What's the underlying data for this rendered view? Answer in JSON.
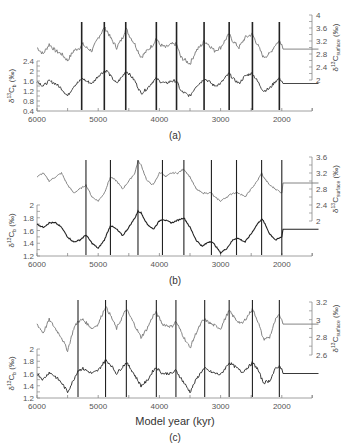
{
  "chart_data": [
    {
      "type": "line",
      "panel_label": "(a)",
      "x_direction": "reversed",
      "xlim": [
        6000,
        1400
      ],
      "x_ticks": [
        "6000",
        "5000",
        "4000",
        "3000",
        "2000"
      ],
      "left_axis": {
        "label": "δ13Cb (‰)",
        "ticks": [
          "0.4",
          "0.8",
          "1.2",
          "1.6",
          "2",
          "2.4"
        ],
        "ylim": [
          0.4,
          2.4
        ]
      },
      "right_axis": {
        "label": "δ13Csurface (‰)",
        "ticks": [
          "2",
          "2.4",
          "2.8",
          "3.2",
          "3.6",
          "4"
        ],
        "ylim": [
          2,
          4
        ]
      },
      "vertical_lines_kyr": [
        5270,
        4900,
        4550,
        4050,
        3720,
        3270,
        2860,
        2480,
        2040
      ],
      "series": [
        {
          "name": "δ13Csurface",
          "axis": "right",
          "color": "#777777",
          "x": [
            6000,
            5900,
            5800,
            5700,
            5600,
            5500,
            5400,
            5300,
            5250,
            5200,
            5100,
            5000,
            4900,
            4850,
            4800,
            4700,
            4600,
            4550,
            4500,
            4400,
            4300,
            4200,
            4100,
            4050,
            4000,
            3900,
            3800,
            3720,
            3650,
            3500,
            3400,
            3300,
            3270,
            3200,
            3100,
            3000,
            2900,
            2860,
            2800,
            2700,
            2600,
            2500,
            2480,
            2400,
            2300,
            2200,
            2100,
            2040,
            2000,
            1980,
            1400
          ],
          "values": [
            3.0,
            2.8,
            3.1,
            2.9,
            2.8,
            2.6,
            2.9,
            3.0,
            3.1,
            3.0,
            2.9,
            3.3,
            3.6,
            3.5,
            3.3,
            3.0,
            3.3,
            3.6,
            3.4,
            3.1,
            2.7,
            2.9,
            3.1,
            3.3,
            3.1,
            3.0,
            3.1,
            3.1,
            2.7,
            2.5,
            2.9,
            3.1,
            3.2,
            3.1,
            2.9,
            3.0,
            3.3,
            3.4,
            3.2,
            3.0,
            3.3,
            3.4,
            3.4,
            3.1,
            2.7,
            2.8,
            3.1,
            3.2,
            3.1,
            2.95,
            2.95
          ]
        },
        {
          "name": "δ13Cb",
          "axis": "left",
          "color": "#333333",
          "x": [
            6000,
            5900,
            5800,
            5700,
            5600,
            5500,
            5400,
            5300,
            5250,
            5200,
            5100,
            5000,
            4900,
            4850,
            4800,
            4700,
            4600,
            4550,
            4500,
            4400,
            4300,
            4200,
            4100,
            4050,
            4000,
            3900,
            3800,
            3720,
            3650,
            3500,
            3400,
            3300,
            3270,
            3200,
            3100,
            3000,
            2900,
            2860,
            2800,
            2700,
            2600,
            2500,
            2480,
            2400,
            2300,
            2200,
            2100,
            2040,
            2000,
            1980,
            1400
          ],
          "values": [
            1.6,
            1.4,
            1.6,
            1.5,
            1.3,
            1.0,
            1.4,
            1.6,
            1.7,
            1.6,
            1.5,
            1.8,
            2.0,
            2.0,
            1.8,
            1.5,
            1.8,
            2.0,
            1.9,
            1.6,
            1.1,
            1.3,
            1.6,
            1.7,
            1.6,
            1.5,
            1.6,
            1.6,
            1.2,
            1.0,
            1.4,
            1.6,
            1.7,
            1.6,
            1.4,
            1.5,
            1.8,
            1.9,
            1.7,
            1.5,
            1.8,
            1.9,
            1.9,
            1.6,
            1.2,
            1.3,
            1.6,
            1.7,
            1.6,
            1.5,
            1.5
          ]
        }
      ]
    },
    {
      "type": "line",
      "panel_label": "(b)",
      "x_direction": "reversed",
      "xlim": [
        6000,
        1400
      ],
      "x_ticks": [
        "6000",
        "5000",
        "4000",
        "3000",
        "2000"
      ],
      "left_axis": {
        "label": "δ13Cb (‰)",
        "ticks": [
          "1.2",
          "1.4",
          "1.6",
          "1.8",
          "2"
        ],
        "ylim": [
          1.2,
          2.0
        ]
      },
      "right_axis": {
        "label": "δ13Csurface (‰)",
        "ticks": [
          "2",
          "2.4",
          "2.8",
          "3.2",
          "3.6"
        ],
        "ylim": [
          2.0,
          3.6
        ]
      },
      "vertical_lines_kyr": [
        5200,
        4800,
        4350,
        3950,
        3600,
        3150,
        2740,
        2330,
        2000
      ],
      "series": [
        {
          "name": "δ13Csurface",
          "axis": "right",
          "color": "#777777",
          "x": [
            6000,
            5900,
            5800,
            5700,
            5600,
            5500,
            5400,
            5300,
            5200,
            5100,
            5000,
            4900,
            4800,
            4700,
            4600,
            4500,
            4400,
            4350,
            4300,
            4200,
            4100,
            4000,
            3950,
            3900,
            3800,
            3700,
            3600,
            3500,
            3400,
            3300,
            3200,
            3150,
            3100,
            3000,
            2900,
            2800,
            2740,
            2700,
            2600,
            2500,
            2400,
            2330,
            2300,
            2200,
            2100,
            2000,
            1980,
            1400
          ],
          "values": [
            3.1,
            3.2,
            3.0,
            3.1,
            3.2,
            2.9,
            2.7,
            2.8,
            2.9,
            2.6,
            2.5,
            2.7,
            3.1,
            3.0,
            2.8,
            3.0,
            3.2,
            3.5,
            3.4,
            3.0,
            2.9,
            3.2,
            3.2,
            3.1,
            3.2,
            3.2,
            3.3,
            3.1,
            2.8,
            2.7,
            2.7,
            2.7,
            2.6,
            2.5,
            2.6,
            2.7,
            2.7,
            2.7,
            2.6,
            2.8,
            3.0,
            3.2,
            3.1,
            2.9,
            2.8,
            2.7,
            2.95,
            2.95
          ]
        },
        {
          "name": "δ13Cb",
          "axis": "left",
          "color": "#222222",
          "x": [
            6000,
            5900,
            5800,
            5700,
            5600,
            5500,
            5400,
            5300,
            5200,
            5100,
            5000,
            4900,
            4800,
            4700,
            4600,
            4500,
            4400,
            4350,
            4300,
            4200,
            4100,
            4000,
            3950,
            3900,
            3800,
            3700,
            3600,
            3500,
            3400,
            3300,
            3200,
            3150,
            3100,
            3000,
            2900,
            2800,
            2740,
            2700,
            2600,
            2500,
            2400,
            2330,
            2300,
            2200,
            2100,
            2000,
            1980,
            1400
          ],
          "values": [
            1.7,
            1.65,
            1.72,
            1.72,
            1.65,
            1.5,
            1.42,
            1.45,
            1.53,
            1.4,
            1.32,
            1.45,
            1.68,
            1.62,
            1.52,
            1.65,
            1.8,
            1.9,
            1.88,
            1.7,
            1.62,
            1.75,
            1.78,
            1.76,
            1.72,
            1.76,
            1.8,
            1.65,
            1.45,
            1.35,
            1.42,
            1.43,
            1.38,
            1.25,
            1.32,
            1.45,
            1.48,
            1.47,
            1.42,
            1.55,
            1.7,
            1.78,
            1.75,
            1.55,
            1.45,
            1.5,
            1.62,
            1.62
          ]
        }
      ]
    },
    {
      "type": "line",
      "panel_label": "(c)",
      "x_direction": "reversed",
      "xlim": [
        6000,
        1400
      ],
      "x_ticks": [
        "6000",
        "5000",
        "4000",
        "3000",
        "2000"
      ],
      "xlabel": "Model year (kyr)",
      "left_axis": {
        "label": "δ13Cb (‰)",
        "ticks": [
          "1.2",
          "1.4",
          "1.6",
          "1.8",
          "2"
        ],
        "ylim": [
          1.2,
          2.0
        ]
      },
      "right_axis": {
        "label": "δ13Csurface (‰)",
        "ticks": [
          "2.6",
          "2.8",
          "3",
          "3.2"
        ],
        "ylim": [
          2.6,
          3.2
        ]
      },
      "vertical_lines_kyr": [
        5330,
        4880,
        4540,
        4050,
        3730,
        3260,
        2860,
        2480,
        2040
      ],
      "series": [
        {
          "name": "δ13Csurface",
          "axis": "right",
          "color": "#777777",
          "x": [
            6000,
            5900,
            5800,
            5700,
            5600,
            5500,
            5400,
            5330,
            5250,
            5100,
            5000,
            4880,
            4800,
            4700,
            4540,
            4450,
            4300,
            4200,
            4100,
            4050,
            3950,
            3800,
            3730,
            3600,
            3500,
            3400,
            3300,
            3260,
            3150,
            3000,
            2900,
            2860,
            2750,
            2650,
            2500,
            2480,
            2400,
            2300,
            2200,
            2100,
            2040,
            2000,
            1980,
            1400
          ],
          "values": [
            2.95,
            2.85,
            3.0,
            2.9,
            2.8,
            2.65,
            2.9,
            2.98,
            3.0,
            2.9,
            2.95,
            3.15,
            3.05,
            2.9,
            3.12,
            3.0,
            2.8,
            2.9,
            3.05,
            3.08,
            2.95,
            2.92,
            2.98,
            2.8,
            2.68,
            2.85,
            2.98,
            3.0,
            2.95,
            2.9,
            3.05,
            3.1,
            3.0,
            2.95,
            3.1,
            3.12,
            3.0,
            2.78,
            2.8,
            3.0,
            3.05,
            3.0,
            2.95,
            2.95
          ]
        },
        {
          "name": "δ13Cb",
          "axis": "left",
          "color": "#222222",
          "x": [
            6000,
            5900,
            5800,
            5700,
            5600,
            5500,
            5400,
            5330,
            5250,
            5100,
            5000,
            4880,
            4800,
            4700,
            4540,
            4450,
            4300,
            4200,
            4100,
            4050,
            3950,
            3800,
            3730,
            3600,
            3500,
            3400,
            3300,
            3260,
            3150,
            3000,
            2900,
            2860,
            2750,
            2650,
            2500,
            2480,
            2400,
            2300,
            2200,
            2100,
            2040,
            2000,
            1980,
            1400
          ],
          "values": [
            1.6,
            1.5,
            1.62,
            1.55,
            1.45,
            1.3,
            1.5,
            1.65,
            1.68,
            1.6,
            1.65,
            1.82,
            1.75,
            1.6,
            1.78,
            1.65,
            1.4,
            1.48,
            1.65,
            1.7,
            1.6,
            1.6,
            1.65,
            1.45,
            1.3,
            1.5,
            1.65,
            1.68,
            1.62,
            1.58,
            1.72,
            1.78,
            1.7,
            1.62,
            1.75,
            1.78,
            1.68,
            1.45,
            1.48,
            1.68,
            1.72,
            1.68,
            1.6,
            1.6
          ]
        }
      ]
    }
  ],
  "labels": {
    "panel_a": "(a)",
    "panel_b": "(b)",
    "panel_c": "(c)",
    "xlabel": "Model year (kyr)",
    "left_ylabel": "δ13Cb (‰)",
    "right_ylabel": "δ13Csurface (‰)"
  }
}
